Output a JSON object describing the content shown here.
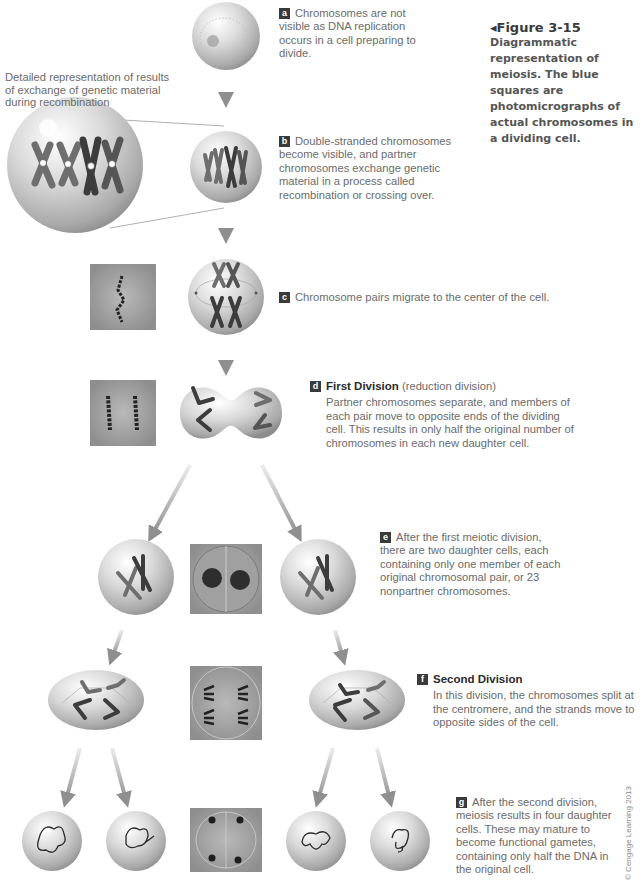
{
  "figure": {
    "number": "Figure 3-15",
    "marker": "◂",
    "caption": "Diagrammatic representation of meiosis. The blue squares are photomicrographs of actual chromosomes in a dividing cell."
  },
  "side_note": "Detailed representation of results of exchange of genetic material during recombination",
  "steps": [
    {
      "letter": "a",
      "title": "",
      "subtitle": "",
      "text": "Chromosomes are not visible as DNA replication occurs in a cell preparing to divide."
    },
    {
      "letter": "b",
      "title": "",
      "subtitle": "",
      "text": "Double-stranded chromosomes become visible, and partner chromosomes exchange genetic material in a process called recombination or crossing over."
    },
    {
      "letter": "c",
      "title": "",
      "subtitle": "",
      "text": "Chromosome pairs migrate to the center of the cell."
    },
    {
      "letter": "d",
      "title": "First Division",
      "subtitle": "(reduction division)",
      "text": "Partner chromosomes separate, and members of each pair move to opposite ends of the dividing cell. This results in only half the original number of chromosomes in each new daughter cell."
    },
    {
      "letter": "e",
      "title": "",
      "subtitle": "",
      "text": "After the first meiotic division, there are two daughter cells, each containing only one member of each original chromosomal pair, or 23 nonpartner chromosomes."
    },
    {
      "letter": "f",
      "title": "Second Division",
      "subtitle": "",
      "text": "In this division, the chromosomes split at the centromere, and the strands move to opposite sides of the cell."
    },
    {
      "letter": "g",
      "title": "",
      "subtitle": "",
      "text": "After the second division, meiosis results in four daughter cells. These may mature to become functional gametes, containing only half the DNA in the original cell."
    }
  ],
  "copyright": "© Cengage Learning 2013",
  "colors": {
    "badge": "#3a3a3a",
    "cell_light": "#f2f2f2",
    "cell_dark": "#a9a9a9",
    "arrow": "#9a9a9a",
    "chromosome_dark": "#3c3c3c",
    "chromosome_mid": "#6e6e6e",
    "micrograph_bg": "#a6a6a6"
  }
}
